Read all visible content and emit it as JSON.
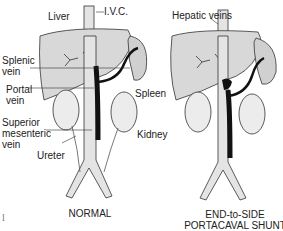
{
  "labels": {
    "ivc": "I.V.C.",
    "liver": "Liver",
    "hepatic_veins": "Hepatic veins",
    "splenic_vein": "Splenic vein",
    "portal_vein": "Portal vein",
    "spleen": "Spleen",
    "kidney": "Kidney",
    "sup_mesenteric_vein": "Superior mesenteric vein",
    "ureter": "Ureter"
  },
  "labels_lines": {
    "splenic_1": "Splenic",
    "splenic_2": "vein",
    "portal_1": "Portal",
    "portal_2": "vein",
    "smv_1": "Superior",
    "smv_2": "mesenteric",
    "smv_3": "vein"
  },
  "captions": {
    "normal": "NORMAL",
    "shunt_1": "END-to-SIDE",
    "shunt_2": "PORTACAVAL SHUNT"
  },
  "margin_mark": "l",
  "colors": {
    "ink": "#1a1a1a",
    "organ_fill": "#d8d8d8",
    "vessel_fill": "#e4e4e4",
    "vein_dark": "#111111"
  }
}
